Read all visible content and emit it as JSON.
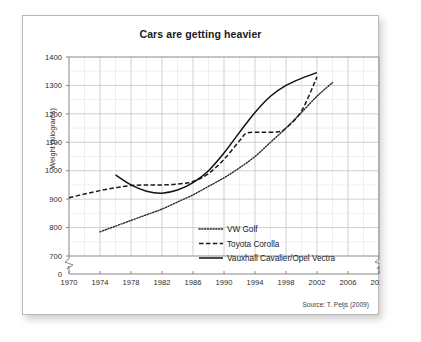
{
  "card": {
    "source_note": "Source: T. Peijs (2009)"
  },
  "chart_data": {
    "type": "line",
    "title": "Cars are getting heavier",
    "xlabel": "",
    "ylabel": "Weight (kilograms)",
    "xlim": [
      1970,
      2010
    ],
    "ylim": [
      650,
      1400
    ],
    "y_axis_break": true,
    "grid": true,
    "legend_position": "center-right-inside",
    "xticks": [
      1970,
      1974,
      1978,
      1982,
      1986,
      1990,
      1994,
      1998,
      2002,
      2006,
      2010
    ],
    "xtick_labels": [
      "1970",
      "1974",
      "1978",
      "1982",
      "1986",
      "1990",
      "1994",
      "1998",
      "2002",
      "2006",
      "2010"
    ],
    "yticks": [
      0,
      700,
      800,
      900,
      1000,
      1100,
      1200,
      1300,
      1400
    ],
    "ytick_labels": [
      "0",
      "700",
      "800",
      "900",
      "1000",
      "1100",
      "1200",
      "1300",
      "1400"
    ],
    "minor_x_interval": 2,
    "minor_y_interval": 50,
    "series": [
      {
        "name": "VW Golf",
        "style": "dotted",
        "color": "#262626",
        "x": [
          1974,
          1976,
          1978,
          1980,
          1982,
          1984,
          1986,
          1988,
          1990,
          1992,
          1994,
          1996,
          1998,
          2000,
          2002,
          2004
        ],
        "values": [
          785,
          805,
          825,
          845,
          865,
          890,
          915,
          945,
          975,
          1010,
          1050,
          1100,
          1150,
          1205,
          1262,
          1310
        ]
      },
      {
        "name": "Toyota Corolla",
        "style": "dashed",
        "color": "#1a1a1a",
        "x": [
          1970,
          1972,
          1974,
          1976,
          1978,
          1980,
          1982,
          1984,
          1986,
          1988,
          1990,
          1992,
          1993,
          1995,
          1997,
          1998,
          2000,
          2002
        ],
        "values": [
          905,
          918,
          930,
          940,
          948,
          950,
          950,
          953,
          962,
          990,
          1040,
          1105,
          1133,
          1135,
          1137,
          1150,
          1210,
          1330
        ]
      },
      {
        "name": "Vauxhall Cavalier/Opel Vectra",
        "style": "solid",
        "color": "#111111",
        "x": [
          1976,
          1978,
          1980,
          1982,
          1984,
          1986,
          1988,
          1990,
          1992,
          1994,
          1996,
          1998,
          2000,
          2002
        ],
        "values": [
          985,
          950,
          928,
          921,
          932,
          958,
          1000,
          1062,
          1135,
          1205,
          1262,
          1300,
          1325,
          1345
        ]
      }
    ]
  },
  "legend": {
    "items": [
      {
        "label": "VW Golf",
        "style": "dotted"
      },
      {
        "label": "Toyota Corolla",
        "style": "dashed"
      },
      {
        "label": "Vauxhall Cavalier/Opel Vectra",
        "style": "solid"
      }
    ]
  }
}
